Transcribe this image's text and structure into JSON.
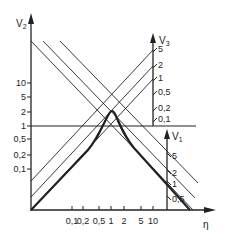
{
  "diagram": {
    "axes": {
      "v2": {
        "label": "V",
        "subscript": "2",
        "ticks": [
          "10",
          "5",
          "2",
          "1",
          "0,5",
          "0,2",
          "0,1"
        ]
      },
      "eta": {
        "label": "η",
        "ticks": [
          "0,1",
          "0,2",
          "0,5",
          "1",
          "2",
          "5",
          "10"
        ]
      },
      "v3": {
        "label": "V",
        "subscript": "3",
        "ticks": [
          "5",
          "2",
          "1",
          "0,5",
          "0,2",
          "0,1"
        ]
      },
      "v1": {
        "label": "V",
        "subscript": "1",
        "ticks": [
          "5",
          "2",
          "1",
          "0,5"
        ]
      }
    },
    "colors": {
      "ink": "#222222",
      "background": "#ffffff"
    }
  }
}
